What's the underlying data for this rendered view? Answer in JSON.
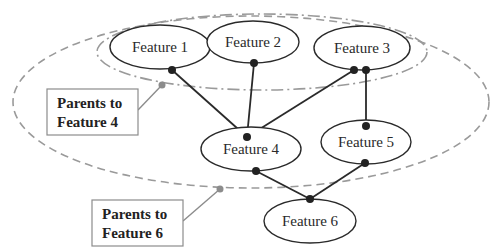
{
  "diagram": {
    "type": "directed-graph",
    "nodes": [
      {
        "id": "f1",
        "label": "Feature 1"
      },
      {
        "id": "f2",
        "label": "Feature 2"
      },
      {
        "id": "f3",
        "label": "Feature 3"
      },
      {
        "id": "f4",
        "label": "Feature 4"
      },
      {
        "id": "f5",
        "label": "Feature 5"
      },
      {
        "id": "f6",
        "label": "Feature 6"
      }
    ],
    "edges": [
      {
        "from": "Feature 1",
        "to": "Feature 4"
      },
      {
        "from": "Feature 2",
        "to": "Feature 4"
      },
      {
        "from": "Feature 3",
        "to": "Feature 4"
      },
      {
        "from": "Feature 3",
        "to": "Feature 5"
      },
      {
        "from": "Feature 4",
        "to": "Feature 6"
      },
      {
        "from": "Feature 5",
        "to": "Feature 6"
      }
    ],
    "groups": [
      {
        "label_line1": "Parents to",
        "label_line2": "Feature 4",
        "style": "dash-dot",
        "members": [
          "Feature 1",
          "Feature 2",
          "Feature 3"
        ]
      },
      {
        "label_line1": "Parents to",
        "label_line2": "Feature 6",
        "style": "dashed",
        "members": [
          "Feature 1",
          "Feature 2",
          "Feature 3",
          "Feature 4",
          "Feature 5"
        ]
      }
    ],
    "colors": {
      "line": "#2a2a2a",
      "group_outline": "#9a9a9a",
      "callout": "#8c8c8c"
    }
  }
}
